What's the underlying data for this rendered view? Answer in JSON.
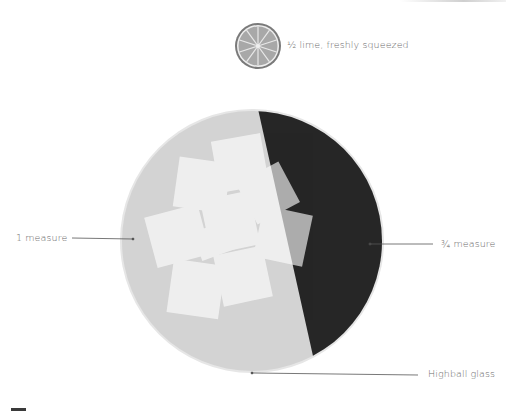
{
  "diagram": {
    "glass": {
      "label": "Highball glass",
      "center": [
        252,
        241
      ],
      "radius": 131,
      "fill_color": "#d3d3d3",
      "rim_color": "#e3e3e3"
    },
    "ingredients": [
      {
        "label": "1 measure",
        "color": "#d3d3d3",
        "side": "left"
      },
      {
        "label": "¾ measure",
        "color": "#262626",
        "side": "right"
      }
    ],
    "garnish": {
      "label": "½ lime, freshly squeezed",
      "icon": "lime-slice-icon",
      "color": "#a9a9a9",
      "rim_color": "#7a7a7a",
      "segments": 10
    },
    "ice_cubes": {
      "count": 9,
      "color": "#f2f2f2"
    },
    "colors": {
      "background": "#ffffff",
      "leader_line": "#555555",
      "text": "#6a6a6a"
    }
  }
}
